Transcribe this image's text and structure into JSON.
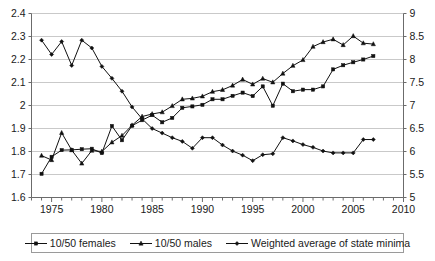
{
  "chart_data": {
    "type": "line",
    "title": "",
    "xlabel": "",
    "ylabel": "",
    "y2label": "",
    "grid": true,
    "legend_position": "bottom",
    "xlim": [
      1973,
      2010
    ],
    "xticks": [
      1975,
      1980,
      1985,
      1990,
      1995,
      2000,
      2005,
      2010
    ],
    "xtick_labels": [
      "1975",
      "1980",
      "1985",
      "1990",
      "1995",
      "2000",
      "2005",
      "2010"
    ],
    "x_minor_tick_step": 1,
    "ylim": [
      1.6,
      2.4
    ],
    "yticks": [
      1.6,
      1.7,
      1.8,
      1.9,
      2.0,
      2.1,
      2.2,
      2.3,
      2.4
    ],
    "ytick_labels": [
      "1.6",
      "1.7",
      "1.8",
      "1.9",
      "2",
      "2.1",
      "2.2",
      "2.3",
      "2.4"
    ],
    "y2lim": [
      5,
      9
    ],
    "y2ticks": [
      5,
      5.5,
      6,
      6.5,
      7,
      7.5,
      8,
      8.5,
      9
    ],
    "y2tick_labels": [
      "5",
      "5.5",
      "6",
      "6.5",
      "7",
      "7.5",
      "8",
      "8.5",
      "9"
    ],
    "series": [
      {
        "name": "10/50 females",
        "marker": "square",
        "axis": "left",
        "x": [
          1974,
          1975,
          1976,
          1977,
          1978,
          1979,
          1980,
          1981,
          1982,
          1983,
          1984,
          1985,
          1986,
          1987,
          1988,
          1989,
          1990,
          1991,
          1992,
          1993,
          1994,
          1995,
          1996,
          1997,
          1998,
          1999,
          2000,
          2001,
          2002,
          2003,
          2004,
          2005,
          2006,
          2007
        ],
        "y": [
          1.703,
          1.777,
          1.806,
          1.807,
          1.81,
          1.812,
          1.793,
          1.911,
          1.849,
          1.912,
          1.936,
          1.958,
          1.927,
          1.946,
          1.99,
          1.996,
          2.003,
          2.027,
          2.027,
          2.042,
          2.056,
          2.041,
          2.083,
          1.999,
          2.095,
          2.062,
          2.069,
          2.069,
          2.083,
          2.157,
          2.175,
          2.188,
          2.2,
          2.215
        ]
      },
      {
        "name": "10/50 males",
        "marker": "triangle",
        "axis": "left",
        "x": [
          1974,
          1975,
          1976,
          1977,
          1978,
          1979,
          1980,
          1981,
          1982,
          1983,
          1984,
          1985,
          1986,
          1987,
          1988,
          1989,
          1990,
          1991,
          1992,
          1993,
          1994,
          1995,
          1996,
          1997,
          1998,
          1999,
          2000,
          2001,
          2002,
          2003,
          2004,
          2005,
          2006,
          2007
        ],
        "y": [
          1.782,
          1.763,
          1.881,
          1.806,
          1.748,
          1.804,
          1.8,
          1.84,
          1.869,
          1.914,
          1.952,
          1.963,
          1.971,
          1.998,
          2.027,
          2.031,
          2.04,
          2.06,
          2.068,
          2.087,
          2.113,
          2.092,
          2.117,
          2.101,
          2.139,
          2.173,
          2.198,
          2.256,
          2.276,
          2.288,
          2.263,
          2.302,
          2.271,
          2.267
        ]
      },
      {
        "name": "Weighted average of state minima",
        "marker": "diamond",
        "axis": "right",
        "x": [
          1974,
          1975,
          1976,
          1977,
          1978,
          1979,
          1980,
          1981,
          1982,
          1983,
          1984,
          1985,
          1986,
          1987,
          1988,
          1989,
          1990,
          1991,
          1992,
          1993,
          1994,
          1995,
          1996,
          1997,
          1998,
          1999,
          2000,
          2001,
          2002,
          2003,
          2004,
          2005,
          2006,
          2007
        ],
        "y": [
          8.42,
          8.11,
          8.39,
          7.87,
          8.42,
          8.25,
          7.85,
          7.59,
          7.31,
          6.97,
          6.71,
          6.5,
          6.4,
          6.3,
          6.22,
          6.07,
          6.3,
          6.3,
          6.14,
          6.01,
          5.92,
          5.8,
          5.93,
          5.95,
          6.3,
          6.23,
          6.15,
          6.09,
          6.01,
          5.97,
          5.97,
          5.97,
          6.26,
          6.26
        ]
      }
    ]
  },
  "legend": {
    "entries": [
      {
        "label": "10/50 females",
        "marker": "square"
      },
      {
        "label": "10/50 males",
        "marker": "triangle"
      },
      {
        "label": "Weighted average of state minima",
        "marker": "diamond"
      }
    ]
  }
}
